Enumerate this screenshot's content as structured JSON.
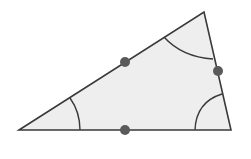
{
  "diagram": {
    "type": "triangle-angles",
    "colors": {
      "background": "#ffffff",
      "fill": "#eeeeee",
      "stroke": "#3a3a3a",
      "dot": "#5a5a5a"
    },
    "triangle": {
      "vertices": [
        [
          19,
          130
        ],
        [
          204,
          12
        ],
        [
          231,
          130
        ]
      ]
    },
    "angle_arcs": [
      {
        "name": "angle-arc-left",
        "path": "M 70 98 Q 80 112 80 130"
      },
      {
        "name": "angle-arc-top",
        "path": "M 164 37 Q 182 57 213 59"
      },
      {
        "name": "angle-arc-right",
        "path": "M 195 130 Q 196 102 222 94"
      }
    ],
    "midpoints": [
      {
        "name": "midpoint-top-left-side",
        "cx": 125,
        "cy": 62
      },
      {
        "name": "midpoint-right-side",
        "cx": 218,
        "cy": 71
      },
      {
        "name": "midpoint-bottom-side",
        "cx": 125,
        "cy": 130
      }
    ]
  }
}
